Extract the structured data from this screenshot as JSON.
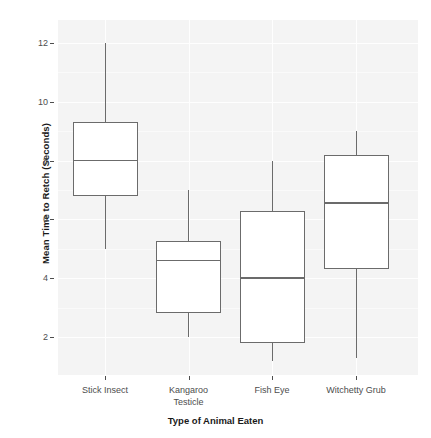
{
  "chart_data": {
    "type": "box",
    "title": "",
    "xlabel": "Type of Animal Eaten",
    "ylabel": "Mean Time to Retch (Seconds)",
    "categories": [
      "Stick Insect",
      "Kangaroo Testicle",
      "Fish Eye",
      "Witchetty Grub"
    ],
    "ylim": [
      1.0,
      12.5
    ],
    "yticks": [
      2,
      4,
      6,
      8,
      10,
      12
    ],
    "ytick_labels": [
      "2",
      "4",
      "6",
      "8",
      "10",
      "12"
    ],
    "grid": true,
    "legend": "none",
    "boxes": [
      {
        "category": "Stick Insect",
        "label_lines": [
          "Stick Insect"
        ],
        "whisker_low": 5.0,
        "q1": 6.8,
        "median": 8.0,
        "q3": 9.3,
        "whisker_high": 12.0
      },
      {
        "category": "Kangaroo Testicle",
        "label_lines": [
          "Kangaroo",
          "Testicle"
        ],
        "whisker_low": 2.0,
        "q1": 2.8,
        "median": 4.6,
        "q3": 5.25,
        "whisker_high": 7.0
      },
      {
        "category": "Fish Eye",
        "label_lines": [
          "Fish Eye"
        ],
        "whisker_low": 1.2,
        "q1": 1.8,
        "median": 4.0,
        "q3": 6.3,
        "whisker_high": 8.0
      },
      {
        "category": "Witchetty Grub",
        "label_lines": [
          "Witchetty Grub"
        ],
        "whisker_low": 1.3,
        "q1": 4.3,
        "median": 6.55,
        "q3": 8.2,
        "whisker_high": 9.0
      }
    ],
    "colors": {
      "panel_background": "#f4f4f4",
      "figure_background": "#ffffff",
      "box_fill": "#ffffff",
      "box_stroke": "#6b6b6b",
      "gridline": "#fefefe",
      "axis_text": "#4d4d4d",
      "axis_title": "#1a1a1a"
    }
  }
}
